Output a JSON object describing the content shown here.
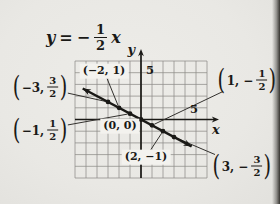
{
  "figure": {
    "title_equation": {
      "y": "y",
      "op": "=",
      "minus": "−",
      "num": "1",
      "den": "2",
      "x": "x"
    }
  },
  "point_labels": {
    "paren_open": "(",
    "paren_close": ")",
    "outside": {
      "neg3": {
        "pre": "−3,",
        "num": "3",
        "den": "2"
      },
      "neg1": {
        "pre": "−1,",
        "num": "1",
        "den": "2"
      },
      "pos1": {
        "pre": "1, −",
        "num": "1",
        "den": "2"
      },
      "pos3": {
        "pre": "3, −",
        "num": "3",
        "den": "2"
      }
    },
    "inside": {
      "m2": {
        "text": "(−2, 1)"
      },
      "origin": {
        "text": "(0, 0)"
      },
      "p2": {
        "text": "(2, −1)"
      }
    }
  },
  "chart_data": {
    "type": "line",
    "slope": -0.5,
    "intercept": 0,
    "x": [
      -3,
      -2,
      -1,
      0,
      1,
      2,
      3
    ],
    "y": [
      1.5,
      1.0,
      0.5,
      0,
      -0.5,
      -1.0,
      -1.5
    ],
    "xlim": [
      -6,
      6
    ],
    "ylim": [
      -5,
      5
    ],
    "grid": true,
    "xlabel": "x",
    "ylabel": "y",
    "ticks": {
      "x": [
        {
          "value": 5,
          "label": "5"
        }
      ],
      "y": [
        {
          "value": 5,
          "label": "5"
        }
      ]
    },
    "line_extent_x": [
      -5.3,
      4.6
    ],
    "annotations": [
      {
        "point": [
          -3,
          1.5
        ],
        "text": "(−3, 3/2)"
      },
      {
        "point": [
          -2,
          1
        ],
        "text": "(−2, 1)"
      },
      {
        "point": [
          -1,
          0.5
        ],
        "text": "(−1, 1/2)"
      },
      {
        "point": [
          0,
          0
        ],
        "text": "(0, 0)"
      },
      {
        "point": [
          1,
          -0.5
        ],
        "text": "(1, −1/2)"
      },
      {
        "point": [
          2,
          -1
        ],
        "text": "(2, −1)"
      },
      {
        "point": [
          3,
          -1.5
        ],
        "text": "(3, −3/2)"
      }
    ]
  },
  "colors": {
    "paper": "#e9e8e4",
    "ink": "#1a1916",
    "grid_line": "#8e8c88",
    "leader": "#33312e",
    "label_bg": "#f3f2ee",
    "scan_edge": "#35332f"
  }
}
